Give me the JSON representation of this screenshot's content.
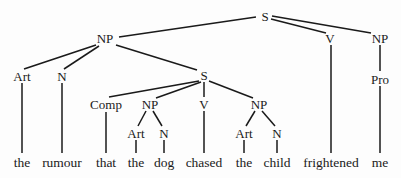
{
  "diagram": {
    "type": "syntax-tree",
    "sentence": "the rumour that the dog chased the child frightened me",
    "line_color": "#1a1a1a",
    "nodes": [
      {
        "id": "s0",
        "label": "S",
        "x": 265,
        "y": 16,
        "kind": "category"
      },
      {
        "id": "np1",
        "label": "NP",
        "x": 105,
        "y": 38,
        "kind": "category"
      },
      {
        "id": "v1",
        "label": "V",
        "x": 330,
        "y": 38,
        "kind": "category"
      },
      {
        "id": "np2",
        "label": "NP",
        "x": 380,
        "y": 38,
        "kind": "category"
      },
      {
        "id": "art1",
        "label": "Art",
        "x": 22,
        "y": 76,
        "kind": "category"
      },
      {
        "id": "n1",
        "label": "N",
        "x": 62,
        "y": 76,
        "kind": "category"
      },
      {
        "id": "s1",
        "label": "S",
        "x": 204,
        "y": 75,
        "kind": "category"
      },
      {
        "id": "pro1",
        "label": "Pro",
        "x": 380,
        "y": 79,
        "kind": "category"
      },
      {
        "id": "comp1",
        "label": "Comp",
        "x": 106,
        "y": 104,
        "kind": "category"
      },
      {
        "id": "np3",
        "label": "NP",
        "x": 150,
        "y": 104,
        "kind": "category"
      },
      {
        "id": "v2",
        "label": "V",
        "x": 204,
        "y": 104,
        "kind": "category"
      },
      {
        "id": "np4",
        "label": "NP",
        "x": 259,
        "y": 104,
        "kind": "category"
      },
      {
        "id": "art2",
        "label": "Art",
        "x": 136,
        "y": 133,
        "kind": "category"
      },
      {
        "id": "n2",
        "label": "N",
        "x": 164,
        "y": 133,
        "kind": "category"
      },
      {
        "id": "art3",
        "label": "Art",
        "x": 244,
        "y": 133,
        "kind": "category"
      },
      {
        "id": "n3",
        "label": "N",
        "x": 277,
        "y": 133,
        "kind": "category"
      },
      {
        "id": "w1",
        "label": "the",
        "x": 22,
        "y": 163,
        "kind": "word"
      },
      {
        "id": "w2",
        "label": "rumour",
        "x": 62,
        "y": 163,
        "kind": "word"
      },
      {
        "id": "w3",
        "label": "that",
        "x": 106,
        "y": 163,
        "kind": "word"
      },
      {
        "id": "w4",
        "label": "the",
        "x": 136,
        "y": 163,
        "kind": "word"
      },
      {
        "id": "w5",
        "label": "dog",
        "x": 164,
        "y": 163,
        "kind": "word"
      },
      {
        "id": "w6",
        "label": "chased",
        "x": 204,
        "y": 163,
        "kind": "word"
      },
      {
        "id": "w7",
        "label": "the",
        "x": 244,
        "y": 163,
        "kind": "word"
      },
      {
        "id": "w8",
        "label": "child",
        "x": 277,
        "y": 163,
        "kind": "word"
      },
      {
        "id": "w9",
        "label": "frightened",
        "x": 331,
        "y": 163,
        "kind": "word"
      },
      {
        "id": "w10",
        "label": "me",
        "x": 380,
        "y": 163,
        "kind": "word"
      }
    ],
    "edges": [
      {
        "from": [
          256,
          17
        ],
        "to": [
          119,
          37
        ]
      },
      {
        "from": [
          271,
          19
        ],
        "to": [
          326,
          33
        ]
      },
      {
        "from": [
          272,
          16
        ],
        "to": [
          371,
          33
        ]
      },
      {
        "from": [
          96,
          45
        ],
        "to": [
          24,
          69
        ]
      },
      {
        "from": [
          99,
          46
        ],
        "to": [
          64,
          69
        ]
      },
      {
        "from": [
          116,
          45
        ],
        "to": [
          197,
          70
        ]
      },
      {
        "from": [
          331,
          45
        ],
        "to": [
          331,
          153
        ]
      },
      {
        "from": [
          380,
          45
        ],
        "to": [
          380,
          71
        ]
      },
      {
        "from": [
          380,
          86
        ],
        "to": [
          380,
          153
        ]
      },
      {
        "from": [
          22,
          83
        ],
        "to": [
          22,
          153
        ]
      },
      {
        "from": [
          62,
          83
        ],
        "to": [
          62,
          153
        ]
      },
      {
        "from": [
          199,
          81
        ],
        "to": [
          109,
          97
        ]
      },
      {
        "from": [
          201,
          82
        ],
        "to": [
          156,
          98
        ]
      },
      {
        "from": [
          204,
          82
        ],
        "to": [
          204,
          97
        ]
      },
      {
        "from": [
          209,
          81
        ],
        "to": [
          253,
          98
        ]
      },
      {
        "from": [
          106,
          112
        ],
        "to": [
          106,
          153
        ]
      },
      {
        "from": [
          146,
          111
        ],
        "to": [
          138,
          126
        ]
      },
      {
        "from": [
          153,
          111
        ],
        "to": [
          162,
          126
        ]
      },
      {
        "from": [
          204,
          111
        ],
        "to": [
          204,
          153
        ]
      },
      {
        "from": [
          255,
          111
        ],
        "to": [
          246,
          126
        ]
      },
      {
        "from": [
          262,
          111
        ],
        "to": [
          275,
          126
        ]
      },
      {
        "from": [
          136,
          140
        ],
        "to": [
          136,
          153
        ]
      },
      {
        "from": [
          164,
          140
        ],
        "to": [
          164,
          153
        ]
      },
      {
        "from": [
          244,
          140
        ],
        "to": [
          244,
          153
        ]
      },
      {
        "from": [
          277,
          140
        ],
        "to": [
          277,
          153
        ]
      }
    ]
  }
}
